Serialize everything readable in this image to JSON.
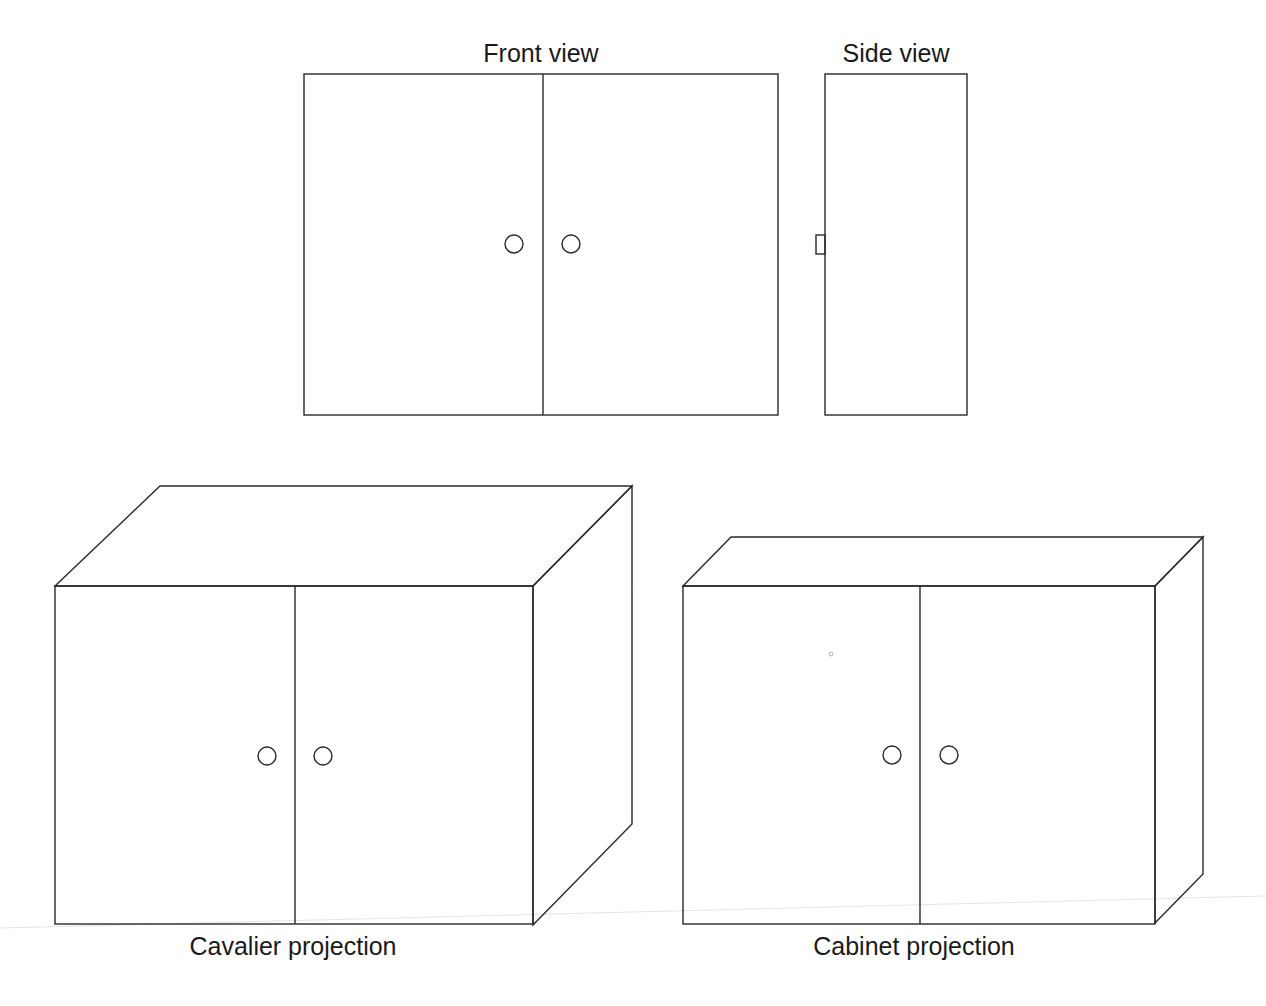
{
  "figure": {
    "type": "technical drawing",
    "stroke_color": "#2a2a2a",
    "background": "#ffffff"
  },
  "views": {
    "front": {
      "label": "Front view",
      "doors": 2,
      "knobs": 2
    },
    "side": {
      "label": "Side view",
      "knobs": 1
    },
    "cavalier": {
      "label": "Cavalier projection",
      "depth_scale": "full",
      "doors": 2,
      "knobs": 2
    },
    "cabinet": {
      "label": "Cabinet projection",
      "depth_scale": "half",
      "doors": 2,
      "knobs": 2
    }
  }
}
